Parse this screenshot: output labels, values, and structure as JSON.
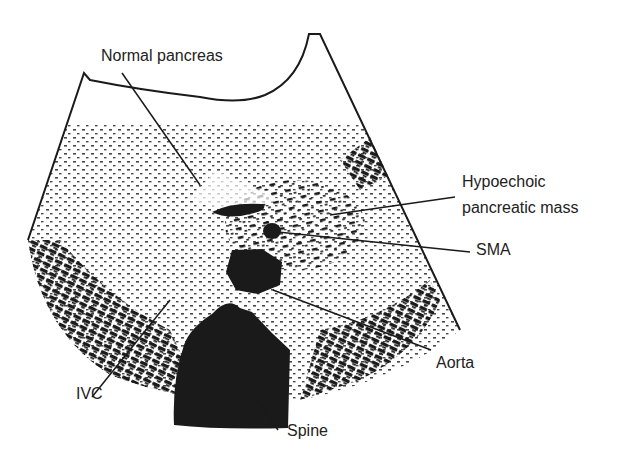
{
  "figure": {
    "type": "ultrasound-illustration",
    "view": "transverse"
  },
  "labels": {
    "normal_pancreas": "Normal pancreas",
    "mass_line1": "Hypoechoic",
    "mass_line2": "pancreatic mass",
    "sma": "SMA",
    "aorta": "Aorta",
    "ivc": "IVC",
    "spine": "Spine"
  },
  "colors": {
    "ink": "#1a1a1a",
    "background": "#ffffff"
  }
}
